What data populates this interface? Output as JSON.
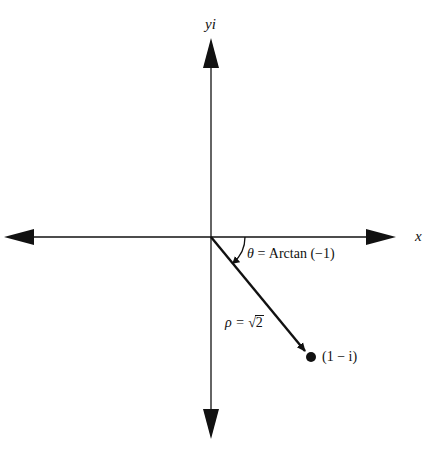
{
  "diagram": {
    "type": "complex-plane-polar-form",
    "axes": {
      "x_label": "x",
      "y_label": "yi"
    },
    "origin": {
      "x": 211,
      "y": 237
    },
    "point": {
      "label": "(1 − i)",
      "x": 311,
      "y": 357
    },
    "vector": {
      "label_prefix": "ρ = ",
      "label_radical": "√",
      "label_radicand": "2"
    },
    "angle": {
      "label_symbol": "θ",
      "label_rest": " = Arctan (−1)"
    },
    "colors": {
      "ink": "#111111",
      "background": "#ffffff"
    }
  }
}
